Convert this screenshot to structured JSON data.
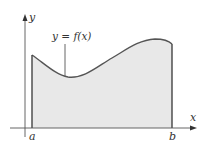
{
  "diagram": {
    "type": "area-under-curve",
    "axes": {
      "x_label": "x",
      "y_label": "y"
    },
    "curve_label": "y = f(x)",
    "bounds": {
      "left_label": "a",
      "right_label": "b"
    },
    "colors": {
      "fill": "#e8e8e8",
      "stroke": "#555555",
      "axis": "#444444",
      "text": "#333333"
    }
  }
}
